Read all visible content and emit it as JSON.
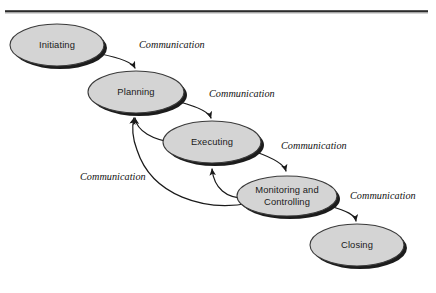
{
  "figure": {
    "top_fragment": "",
    "width": 436,
    "height": 293,
    "background_color": "#ffffff"
  },
  "colors": {
    "node_fill": "#d4d4d4",
    "node_stroke": "#3a3a3a",
    "node_shadow": "#1c1c1c",
    "arrow": "#1a1a1a",
    "rule_dark": "#2b2b2b",
    "rule_light": "#9a9a9a",
    "label_text": "#1a1a1a"
  },
  "divider": {
    "name": "top-horizontal-rule",
    "x": 5,
    "y": 10,
    "width": 423,
    "thickness": 3
  },
  "nodes": [
    {
      "id": "initiating",
      "label": "Initiating",
      "cx": 57,
      "cy": 45,
      "rx": 47,
      "ry": 21
    },
    {
      "id": "planning",
      "label": "Planning",
      "cx": 136,
      "cy": 92,
      "rx": 48,
      "ry": 21
    },
    {
      "id": "executing",
      "label": "Executing",
      "cx": 212,
      "cy": 142,
      "rx": 49,
      "ry": 21
    },
    {
      "id": "monitoring-and-controlling",
      "label_line1": "Monitoring and",
      "label_line2": "Controlling",
      "label": "Monitoring and Controlling",
      "cx": 287,
      "cy": 196,
      "rx": 50,
      "ry": 20
    },
    {
      "id": "closing",
      "label": "Closing",
      "cx": 357,
      "cy": 245,
      "rx": 47,
      "ry": 21
    }
  ],
  "edges": [
    {
      "id": "initiating-to-planning",
      "from": "initiating",
      "to": "planning",
      "label": "Communication",
      "label_x": 139,
      "label_y": 46
    },
    {
      "id": "planning-to-executing",
      "from": "planning",
      "to": "executing",
      "label": "Communication",
      "label_x": 209,
      "label_y": 95
    },
    {
      "id": "executing-to-monitoring",
      "from": "executing",
      "to": "monitoring-and-controlling",
      "label": "Communication",
      "label_x": 281,
      "label_y": 147
    },
    {
      "id": "monitoring-to-closing",
      "from": "monitoring-and-controlling",
      "to": "closing",
      "label": "Communication",
      "label_x": 350,
      "label_y": 197
    },
    {
      "id": "feedback-loops",
      "from": "monitoring-and-controlling",
      "to": "planning",
      "label": "Communication",
      "label_x": 80,
      "label_y": 178
    }
  ]
}
